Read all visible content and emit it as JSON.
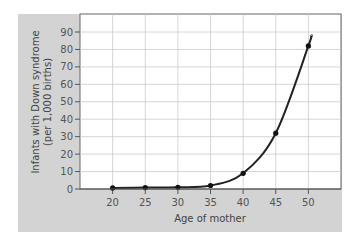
{
  "chart_data": {
    "type": "line",
    "title": "",
    "xlabel": "Age of mother",
    "ylabel": "Infants with Down syndrome (per 1,000 births)",
    "ylabel_lines": [
      "Infants with Down syndrome",
      "(per 1,000 births)"
    ],
    "x": [
      20,
      25,
      30,
      35,
      40,
      45,
      50
    ],
    "series": [
      {
        "name": "Infants with Down syndrome",
        "values": [
          0.6,
          0.8,
          1,
          2,
          9,
          32,
          82
        ]
      }
    ],
    "x_ticks": [
      "20",
      "25",
      "30",
      "35",
      "40",
      "45",
      "50"
    ],
    "y_ticks": [
      "0",
      "10",
      "20",
      "30",
      "40",
      "50",
      "60",
      "70",
      "80",
      "90"
    ],
    "xlim": [
      15,
      55
    ],
    "ylim": [
      0,
      100
    ],
    "grid": true,
    "legend": "none",
    "colors": {
      "panel": "#d3d3d3",
      "plot_bg": "#ffffff",
      "grid": "#cccccc",
      "line": "#222222"
    }
  }
}
